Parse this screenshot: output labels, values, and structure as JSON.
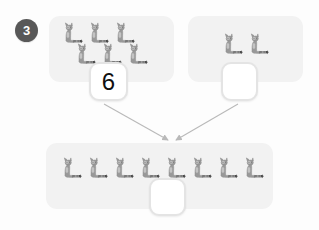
{
  "worksheet": {
    "question_number": "3",
    "type": "addition-with-pictures",
    "background_color": "#fdfdfd",
    "panel_color": "#f2f2f2",
    "badge_color": "#585858",
    "arrow_color": "#b5b5b5",
    "counter_icon": "cat-counter-icon",
    "counter_label": "cat"
  },
  "addend_a": {
    "panel_name": "first-addend-group",
    "count": 6,
    "rows": [
      3,
      3
    ],
    "answer": {
      "value": "6",
      "filled": true,
      "placeholder": ""
    }
  },
  "addend_b": {
    "panel_name": "second-addend-group",
    "count": 2,
    "rows": [
      2
    ],
    "answer": {
      "value": "",
      "filled": false,
      "placeholder": ""
    }
  },
  "sum": {
    "panel_name": "total-group",
    "count": 8,
    "rows": [
      8
    ],
    "answer": {
      "value": "",
      "filled": false,
      "placeholder": ""
    }
  },
  "arrows": [
    {
      "name": "arrow-from-first-addend",
      "from": "tile-a",
      "to": "sum-panel"
    },
    {
      "name": "arrow-from-second-addend",
      "from": "tile-b",
      "to": "sum-panel"
    }
  ],
  "chart_data": {
    "type": "bar",
    "title": "",
    "categories": [
      "first addend",
      "second addend",
      "sum"
    ],
    "values": [
      6,
      2,
      8
    ],
    "xlabel": "",
    "ylabel": "count of cats",
    "ylim": [
      0,
      8
    ]
  }
}
